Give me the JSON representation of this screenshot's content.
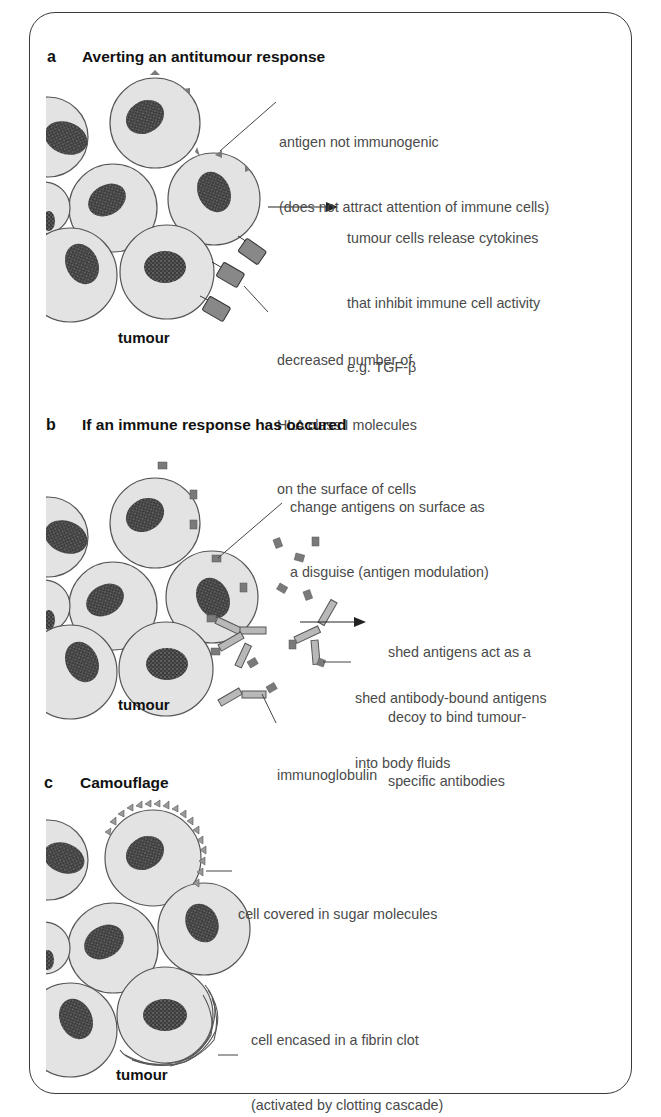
{
  "panels": [
    {
      "letter": "a",
      "title": "Averting an antitumour response",
      "tumour_label": "tumour",
      "annotations": [
        {
          "lines": [
            "antigen not immunogenic",
            "(does not attract attention of immune cells)"
          ]
        },
        {
          "lines": [
            "tumour cells release cytokines",
            "that inhibit immune cell activity",
            "e.g. TGF-β"
          ]
        },
        {
          "lines": [
            "decreased number of",
            "HLA class I molecules",
            "on the surface of cells"
          ]
        }
      ]
    },
    {
      "letter": "b",
      "title": "If an immune response has occured",
      "tumour_label": "tumour",
      "annotations": [
        {
          "lines": [
            "change antigens on surface as",
            "a disguise (antigen modulation)"
          ]
        },
        {
          "lines": [
            "shed antigens act as a",
            "decoy to bind tumour-",
            "specific antibodies"
          ]
        },
        {
          "lines": [
            "shed antibody-bound antigens",
            "into body fluids"
          ]
        },
        {
          "lines": [
            "immunoglobulin"
          ]
        }
      ]
    },
    {
      "letter": "c",
      "title": "Camouflage",
      "tumour_label": "tumour",
      "annotations": [
        {
          "lines": [
            "cell covered in sugar molecules"
          ]
        },
        {
          "lines": [
            "cell encased in a fibrin clot",
            "(activated by clotting cascade)"
          ]
        }
      ]
    }
  ],
  "colors": {
    "cell_fill": "#e3e3e3",
    "cell_stroke": "#555555",
    "nucleus": "#4a4a4a",
    "antigen": "#7a7a7a",
    "antibody": "#b8b8b8",
    "frame": "#3a3a3a"
  }
}
